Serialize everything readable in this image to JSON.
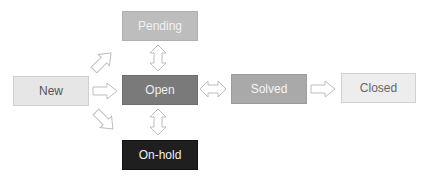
{
  "diagram": {
    "nodes": [
      {
        "id": "new",
        "label": "New",
        "bg": "#e6e6e6",
        "fg": "#555555",
        "border": "#cfcfcf"
      },
      {
        "id": "pending",
        "label": "Pending",
        "bg": "#bdbdbd",
        "fg": "#f2f2f2",
        "border": "#b0b0b0"
      },
      {
        "id": "open",
        "label": "Open",
        "bg": "#7a7a7a",
        "fg": "#eeeeee",
        "border": "#6e6e6e"
      },
      {
        "id": "solved",
        "label": "Solved",
        "bg": "#a9a9a9",
        "fg": "#f5f5f5",
        "border": "#9c9c9c"
      },
      {
        "id": "closed",
        "label": "Closed",
        "bg": "#ededed",
        "fg": "#666666",
        "border": "#cfcfcf"
      },
      {
        "id": "onhold",
        "label": "On-hold",
        "bg": "#1f1f1f",
        "fg": "#f0f0f0",
        "border": "#111111"
      }
    ],
    "edges": [
      {
        "from": "new",
        "to": "pending",
        "type": "one-way"
      },
      {
        "from": "new",
        "to": "open",
        "type": "one-way"
      },
      {
        "from": "new",
        "to": "onhold",
        "type": "one-way"
      },
      {
        "from": "pending",
        "to": "open",
        "type": "two-way"
      },
      {
        "from": "open",
        "to": "onhold",
        "type": "two-way"
      },
      {
        "from": "open",
        "to": "solved",
        "type": "two-way"
      },
      {
        "from": "solved",
        "to": "closed",
        "type": "one-way"
      }
    ]
  }
}
